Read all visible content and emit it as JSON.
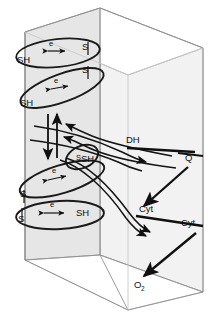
{
  "figure": {
    "type": "biochemical-diagram",
    "background_color": "#ffffff",
    "line_color": "#111111",
    "panel_color": "#e6e6e6",
    "panel_color_light": "#f2f2f2"
  },
  "left_panel": {
    "name": "left-membrane-panel",
    "redox_couples": [
      {
        "id": "couple-1",
        "left_label": "SH",
        "carrier_label": "e",
        "right_label": "S",
        "arrow": "double"
      },
      {
        "id": "couple-2",
        "left_label": "SH",
        "carrier_label": "e",
        "right_label": "S",
        "arrow": "double"
      },
      {
        "id": "couple-3",
        "left_label": "S",
        "carrier_label": "e",
        "right_label": "SH",
        "arrow": "double"
      },
      {
        "id": "couple-4",
        "left_label": "S",
        "carrier_label": "e",
        "right_label": "SH",
        "arrow": "double"
      }
    ],
    "vertical_arrows": [
      {
        "id": "vertical-arrow-up",
        "direction": "up"
      },
      {
        "id": "vertical-arrow-down",
        "direction": "down"
      }
    ]
  },
  "right_panel": {
    "name": "right-membrane-panel",
    "carriers": [
      {
        "id": "carrier-dh",
        "label": "DH"
      },
      {
        "id": "carrier-q",
        "label": "Q"
      },
      {
        "id": "carrier-cyt-1",
        "label": "Cyt"
      },
      {
        "id": "carrier-cyt-2",
        "label": "Cyt"
      },
      {
        "id": "terminal-acceptor",
        "label": "O",
        "subscript": "2"
      }
    ],
    "transfer_arrows": [
      {
        "id": "arrow-q-to-cyt",
        "from": "Q",
        "to": "Cyt"
      },
      {
        "id": "arrow-cyt-to-o2",
        "from": "Cyt",
        "to": "O2"
      }
    ]
  },
  "cross_arrows": [
    {
      "id": "cross-arrow-in-1",
      "direction": "left-to-right"
    },
    {
      "id": "cross-arrow-in-2",
      "direction": "left-to-right"
    },
    {
      "id": "cross-arrow-out-1",
      "direction": "right-to-left"
    },
    {
      "id": "cross-arrow-out-2",
      "direction": "right-to-left"
    }
  ]
}
